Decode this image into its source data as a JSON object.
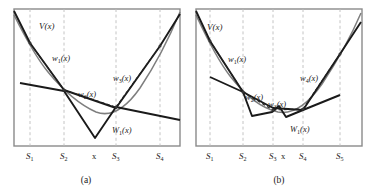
{
  "figure": {
    "type": "line-diagram-pair",
    "background": "#ffffff",
    "stroke_dark": "#1a1a1a",
    "stroke_gray": "#8a8a8a",
    "stroke_grid": "#b9b9b9"
  },
  "panels": [
    {
      "id": "a",
      "caption": "(a)",
      "frame": {
        "x": 14,
        "y": 9,
        "w": 166,
        "h": 137
      },
      "value_function_label": "V(x)",
      "axis_ticks": [
        {
          "label": "S",
          "sub": "1",
          "x": 30,
          "gridline": true
        },
        {
          "label": "S",
          "sub": "2",
          "x": 64,
          "gridline": true
        },
        {
          "label": "x",
          "sub": "",
          "x": 95,
          "gridline": false
        },
        {
          "label": "S",
          "sub": "3",
          "x": 116,
          "gridline": true
        },
        {
          "label": "S",
          "sub": "4",
          "x": 160,
          "gridline": true
        }
      ],
      "curve_labels": [
        {
          "label": "V",
          "sub": "",
          "x": 40,
          "y": 26,
          "italic": true
        },
        {
          "label": "w",
          "sub": "1",
          "x": 52,
          "y": 58
        },
        {
          "label": "w",
          "sub": "2",
          "x": 80,
          "y": 95
        },
        {
          "label": "w",
          "sub": "3",
          "x": 114,
          "y": 79
        },
        {
          "label": "W",
          "sub": "1",
          "x": 113,
          "y": 131,
          "cap": true
        }
      ],
      "smooth_curve": "M14,15 L22,30 L30,44 L40,60 L50,74 L60,86 L70,96 L80,104 L90,110 L95,112 L100,113 L106,112 L112,109 L120,103 L128,94 L136,83 L144,70 L152,56 L160,42 L168,28 L176,16 L180,11",
      "thick_upper": "M14,11 L30,43 L64,90 L116,108 L160,46 L180,15",
      "thick_lower": "M22,84 L64,91 L95,138 L116,107 L180,120",
      "dashed_segments": [
        "M30,43 L64,90",
        "M64,90 L116,107",
        "M116,107 L160,46"
      ]
    },
    {
      "id": "b",
      "caption": "(b)",
      "frame": {
        "x": 196,
        "y": 9,
        "w": 166,
        "h": 137
      },
      "value_function_label": "V(x)",
      "axis_ticks": [
        {
          "label": "S",
          "sub": "1",
          "x": 210,
          "gridline": true
        },
        {
          "label": "S",
          "sub": "2",
          "x": 243,
          "gridline": true
        },
        {
          "label": "S",
          "sub": "3",
          "x": 273,
          "gridline": true
        },
        {
          "label": "x",
          "sub": "",
          "x": 285,
          "gridline": false
        },
        {
          "label": "S",
          "sub": "4",
          "x": 303,
          "gridline": true
        },
        {
          "label": "S",
          "sub": "5",
          "x": 340,
          "gridline": true
        }
      ],
      "curve_labels": [
        {
          "label": "V",
          "sub": "",
          "x": 208,
          "y": 27,
          "italic": true
        },
        {
          "label": "w",
          "sub": "1",
          "x": 228,
          "y": 60
        },
        {
          "label": "w",
          "sub": "2",
          "x": 246,
          "y": 98
        },
        {
          "label": "w",
          "sub": "3",
          "x": 268,
          "y": 106
        },
        {
          "label": "w",
          "sub": "4",
          "x": 301,
          "y": 79
        },
        {
          "label": "W",
          "sub": "1",
          "x": 291,
          "y": 130,
          "cap": true
        }
      ],
      "smooth_curve": "M196,15 L204,30 L212,45 L222,62 L232,77 L242,90 L252,100 L262,107 L272,111 L280,112 L288,111 L296,107 L304,101 L312,92 L320,81 L328,68 L336,54 L344,40 L352,26 L360,13",
      "thick_upper": "M196,11 L210,41 L243,92 L273,108 L303,110 L340,54 L362,22",
      "thick_lower": "M210,78 L243,92 L252,115 L273,112 L279,107 L285,116 L303,110 L340,96 L340,96",
      "dashed_segments": [
        "M210,41 L243,92",
        "M243,92 L273,110",
        "M273,110 L303,109",
        "M303,109 L340,54"
      ]
    }
  ]
}
